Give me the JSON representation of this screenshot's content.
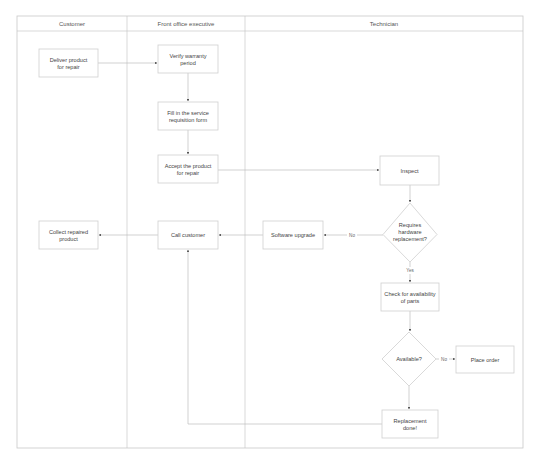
{
  "diagram": {
    "type": "swimlane-flowchart",
    "colors": {
      "line": "#bdbdbd",
      "border": "#cfcfcf",
      "text": "#444444",
      "arrowhead": "#555555"
    },
    "lanes": [
      {
        "id": "customer",
        "title": "Customer"
      },
      {
        "id": "front_office",
        "title": "Front office executive"
      },
      {
        "id": "technician",
        "title": "Technician"
      }
    ],
    "nodes": [
      {
        "id": "deliver",
        "lane": "customer",
        "shape": "process",
        "lines": [
          "Deliver product",
          "for repair"
        ]
      },
      {
        "id": "verify",
        "lane": "front_office",
        "shape": "process",
        "lines": [
          "Verify warranty",
          "period"
        ]
      },
      {
        "id": "fill",
        "lane": "front_office",
        "shape": "process",
        "lines": [
          "Fill in the service",
          "requisition form"
        ]
      },
      {
        "id": "accept",
        "lane": "front_office",
        "shape": "process",
        "lines": [
          "Accept the product",
          "for repair"
        ]
      },
      {
        "id": "inspect",
        "lane": "technician",
        "shape": "process",
        "lines": [
          "Inspect"
        ]
      },
      {
        "id": "requires",
        "lane": "technician",
        "shape": "decision",
        "lines": [
          "Requires",
          "hardware",
          "replacement?"
        ]
      },
      {
        "id": "software",
        "lane": "technician",
        "shape": "process",
        "lines": [
          "Software upgrade"
        ]
      },
      {
        "id": "call",
        "lane": "front_office",
        "shape": "process",
        "lines": [
          "Call customer"
        ]
      },
      {
        "id": "collect",
        "lane": "customer",
        "shape": "process",
        "lines": [
          "Collect repaired",
          "product"
        ]
      },
      {
        "id": "check",
        "lane": "technician",
        "shape": "process",
        "lines": [
          "Check for availability",
          "of parts"
        ]
      },
      {
        "id": "available",
        "lane": "technician",
        "shape": "decision",
        "lines": [
          "Available?"
        ]
      },
      {
        "id": "order",
        "lane": "technician",
        "shape": "process",
        "lines": [
          "Place order"
        ]
      },
      {
        "id": "replacement",
        "lane": "technician",
        "shape": "process",
        "lines": [
          "Replacement",
          "done!"
        ]
      }
    ],
    "edges": [
      {
        "from": "deliver",
        "to": "verify",
        "label": ""
      },
      {
        "from": "verify",
        "to": "fill",
        "label": ""
      },
      {
        "from": "fill",
        "to": "accept",
        "label": ""
      },
      {
        "from": "accept",
        "to": "inspect",
        "label": ""
      },
      {
        "from": "inspect",
        "to": "requires",
        "label": ""
      },
      {
        "from": "requires",
        "to": "software",
        "label": "No"
      },
      {
        "from": "requires",
        "to": "check",
        "label": "Yes"
      },
      {
        "from": "software",
        "to": "call",
        "label": ""
      },
      {
        "from": "call",
        "to": "collect",
        "label": ""
      },
      {
        "from": "check",
        "to": "available",
        "label": ""
      },
      {
        "from": "available",
        "to": "order",
        "label": "No"
      },
      {
        "from": "available",
        "to": "replacement",
        "label": ""
      },
      {
        "from": "replacement",
        "to": "call",
        "label": ""
      }
    ]
  }
}
